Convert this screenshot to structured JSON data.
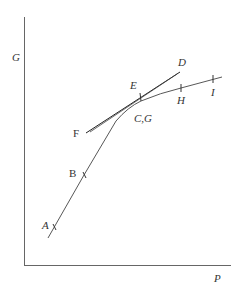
{
  "axes": {
    "y_label": "G",
    "x_label": "P",
    "color": "#555555"
  },
  "curve": {
    "name": "G-P curve",
    "points": [
      "A",
      "B",
      "C,G",
      "H",
      "I"
    ],
    "color": "#444444"
  },
  "tangent_lines": [
    {
      "from": "F",
      "to": "D",
      "color": "#222222"
    }
  ],
  "labels": {
    "A": "A",
    "B": "B",
    "CG": "C,G",
    "D": "D",
    "E": "E",
    "F": "F",
    "H": "H",
    "I": "I"
  }
}
